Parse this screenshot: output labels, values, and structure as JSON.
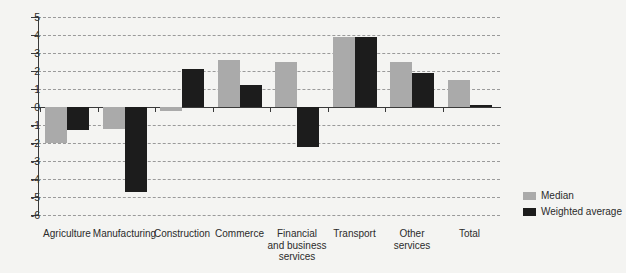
{
  "chart_data": {
    "type": "bar",
    "title": "",
    "xlabel": "",
    "ylabel": "",
    "ylim": [
      -6,
      5
    ],
    "yticks": [
      5,
      4,
      3,
      2,
      1,
      0,
      -1,
      -2,
      -3,
      -4,
      -5,
      -6
    ],
    "ytick_labels": [
      "5",
      "4",
      "3",
      "2",
      "1",
      "0",
      "-1",
      "-2",
      "-3",
      "-4",
      "-5",
      "-6"
    ],
    "grid": true,
    "legend_position": "bottom-right",
    "categories": [
      "Agriculture",
      "Manufacturing",
      "Construction",
      "Commerce",
      "Financial\nand business\nservices",
      "Transport",
      "Other\nservices",
      "Total"
    ],
    "series": [
      {
        "name": "Median",
        "color": "#aaaaaa",
        "values": [
          -2.0,
          -1.2,
          -0.2,
          2.6,
          2.5,
          3.9,
          2.5,
          1.5
        ]
      },
      {
        "name": "Weighted average",
        "color": "#1c1c1c",
        "values": [
          -1.3,
          -4.7,
          2.1,
          1.2,
          -2.2,
          3.9,
          1.9,
          0.1
        ]
      }
    ]
  },
  "legend": {
    "items": [
      {
        "label": "Median",
        "color": "#aaaaaa"
      },
      {
        "label": "Weighted average",
        "color": "#1c1c1c"
      }
    ]
  },
  "colors": {
    "background": "#f4f4f2",
    "axis": "#3a3a3a",
    "grid": "#9a9a9a",
    "median": "#aaaaaa",
    "weighted": "#1c1c1c"
  }
}
